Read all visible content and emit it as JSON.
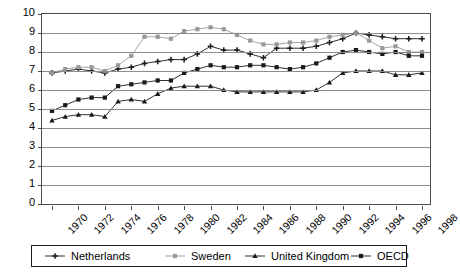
{
  "chart_data": {
    "type": "line",
    "title": "",
    "xlabel": "",
    "ylabel": "",
    "ylim": [
      0,
      10
    ],
    "ytick_labels": [
      "0",
      "1",
      "2",
      "3",
      "4",
      "5",
      "6",
      "7",
      "8",
      "9",
      "10"
    ],
    "yticks": [
      0,
      1,
      2,
      3,
      4,
      5,
      6,
      7,
      8,
      9,
      10
    ],
    "grid": true,
    "legend_position": "bottom",
    "x": [
      1970,
      1971,
      1972,
      1973,
      1974,
      1975,
      1976,
      1977,
      1978,
      1979,
      1980,
      1981,
      1982,
      1983,
      1984,
      1985,
      1986,
      1987,
      1988,
      1989,
      1990,
      1991,
      1992,
      1993,
      1994,
      1995,
      1996,
      1997,
      1998
    ],
    "xtick_labels": [
      "1970",
      "1972",
      "1974",
      "1976",
      "1978",
      "1980",
      "1982",
      "1984",
      "1986",
      "1988",
      "1990",
      "1992",
      "1994",
      "1996",
      "1998"
    ],
    "xticks": [
      1970,
      1972,
      1974,
      1976,
      1978,
      1980,
      1982,
      1984,
      1986,
      1988,
      1990,
      1992,
      1994,
      1996,
      1998
    ],
    "series": [
      {
        "name": "Netherlands",
        "marker": "plus",
        "color": "#1a1a1a",
        "values": [
          6.9,
          7.0,
          7.1,
          7.0,
          6.9,
          7.1,
          7.2,
          7.4,
          7.5,
          7.6,
          7.6,
          7.9,
          8.3,
          8.1,
          8.1,
          7.9,
          7.7,
          8.2,
          8.2,
          8.2,
          8.3,
          8.5,
          8.7,
          9.0,
          8.9,
          8.8,
          8.7,
          8.7,
          8.7
        ]
      },
      {
        "name": "Sweden",
        "marker": "square",
        "color": "#999999",
        "values": [
          6.9,
          7.1,
          7.2,
          7.2,
          7.0,
          7.3,
          7.8,
          8.8,
          8.8,
          8.7,
          9.1,
          9.2,
          9.3,
          9.2,
          8.9,
          8.6,
          8.4,
          8.4,
          8.5,
          8.5,
          8.6,
          8.8,
          8.9,
          9.0,
          8.6,
          8.2,
          8.3,
          8.0,
          8.0
        ]
      },
      {
        "name": "United Kingdom",
        "marker": "triangle",
        "color": "#1a1a1a",
        "values": [
          4.4,
          4.6,
          4.7,
          4.7,
          4.6,
          5.4,
          5.5,
          5.4,
          5.8,
          6.1,
          6.2,
          6.2,
          6.2,
          6.0,
          5.9,
          5.9,
          5.9,
          5.9,
          5.9,
          5.9,
          6.0,
          6.4,
          6.9,
          7.0,
          7.0,
          7.0,
          6.8,
          6.8,
          6.9
        ]
      },
      {
        "name": "OECD",
        "marker": "square-filled",
        "color": "#1a1a1a",
        "values": [
          4.9,
          5.2,
          5.5,
          5.6,
          5.6,
          6.2,
          6.3,
          6.4,
          6.5,
          6.5,
          6.9,
          7.1,
          7.3,
          7.2,
          7.2,
          7.3,
          7.3,
          7.2,
          7.1,
          7.2,
          7.4,
          7.7,
          8.0,
          8.1,
          8.0,
          7.9,
          8.0,
          7.8,
          7.8
        ]
      }
    ]
  },
  "legend": {
    "items": [
      {
        "label": "Netherlands"
      },
      {
        "label": "Sweden"
      },
      {
        "label": "United Kingdom"
      },
      {
        "label": "OECD"
      }
    ]
  }
}
